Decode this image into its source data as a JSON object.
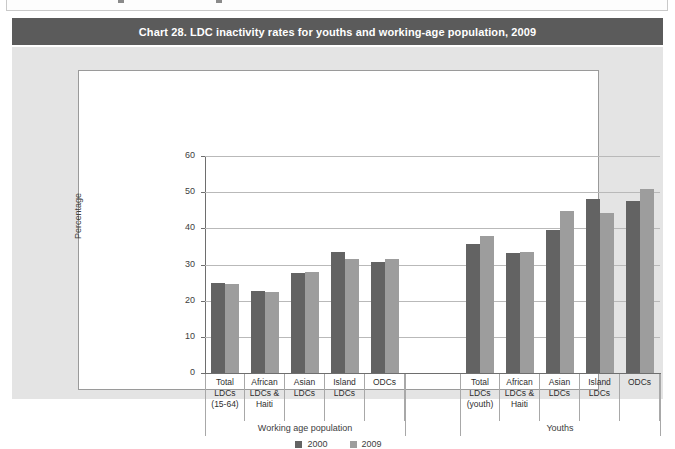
{
  "document": {
    "top_row_partial": ""
  },
  "banner": {
    "title": "Chart 28. LDC inactivity rates for youths and working-age population, 2009"
  },
  "legend": {
    "position": "bottom-center",
    "items": [
      {
        "label": "2000",
        "color": "#636363"
      },
      {
        "label": "2009",
        "color": "#9d9d9d"
      }
    ]
  },
  "chart_data": {
    "type": "bar",
    "title": "Chart 28. LDC inactivity rates for youths and working-age population, 2009",
    "xlabel": "",
    "ylabel": "Percentage",
    "ylim": [
      0,
      60
    ],
    "yticks": [
      0,
      10,
      20,
      30,
      40,
      50,
      60
    ],
    "grid": true,
    "legend_position": "bottom-center",
    "categories": [
      "Total LDCs (15-64)",
      "African LDCs & Haiti",
      "Asian LDCs",
      "Island LDCs",
      "ODCs",
      "Total LDCs (youth)",
      "African LDCs & Haiti",
      "Asian LDCs",
      "Island LDCs",
      "ODCs"
    ],
    "category_lines": [
      [
        "Total",
        "LDCs",
        "(15-64)"
      ],
      [
        "African",
        "LDCs &",
        "Haiti"
      ],
      [
        "Asian",
        "LDCs"
      ],
      [
        "Island",
        "LDCs"
      ],
      [
        "ODCs"
      ],
      [
        "Total",
        "LDCs",
        "(youth)"
      ],
      [
        "African",
        "LDCs &",
        "Haiti"
      ],
      [
        "Asian",
        "LDCs"
      ],
      [
        "Island",
        "LDCs"
      ],
      [
        "ODCs"
      ]
    ],
    "groups": [
      {
        "label": "Working age population",
        "start": 0,
        "end": 4
      },
      {
        "label": "Youths",
        "start": 5,
        "end": 9
      }
    ],
    "series": [
      {
        "name": "2000",
        "color": "#636363",
        "values": [
          24.8,
          22.8,
          27.7,
          33.5,
          30.8,
          35.6,
          33.3,
          39.6,
          48.1,
          47.6
        ]
      },
      {
        "name": "2009",
        "color": "#9d9d9d",
        "values": [
          24.5,
          22.3,
          27.9,
          31.5,
          31.5,
          37.8,
          33.5,
          44.7,
          44.3,
          51.0
        ]
      }
    ]
  },
  "colors": {
    "banner_bg": "#5b5b5b",
    "panel_bg": "#e4e4e4",
    "plot_bg": "#ffffff",
    "gridline": "#b9b9b9",
    "axis": "#6e6e6e"
  }
}
